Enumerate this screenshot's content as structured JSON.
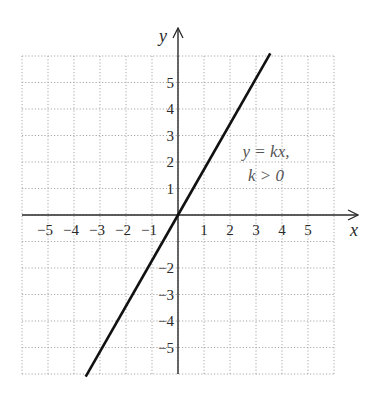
{
  "chart_data": {
    "type": "line",
    "title": "",
    "xlabel": "x",
    "ylabel": "y",
    "xlim": [
      -6,
      6
    ],
    "ylim": [
      -6,
      6
    ],
    "grid": true,
    "grid_style": "dotted",
    "x_ticks": [
      "-5",
      "-4",
      "-3",
      "-2",
      "-1",
      "1",
      "2",
      "3",
      "4",
      "5"
    ],
    "y_ticks_positive": [
      "5",
      "4",
      "3",
      "2",
      "1"
    ],
    "y_ticks_negative": [
      "-2",
      "-3",
      "-4",
      "-5"
    ],
    "series": [
      {
        "name": "y = kx, k > 0",
        "x": [
          -3.55,
          0,
          3.55
        ],
        "y": [
          -6.1,
          0,
          6.1
        ],
        "slope_k": 1.72,
        "color": "#111111"
      }
    ],
    "annotations": [
      {
        "line1": "y = kx,",
        "line2": "k > 0",
        "x": 2.5,
        "y": 2.2
      }
    ],
    "legend": null
  },
  "colors": {
    "axis": "#2a2a2a",
    "grid": "#a8a8a8",
    "line": "#111111",
    "annotation": "#555555"
  }
}
